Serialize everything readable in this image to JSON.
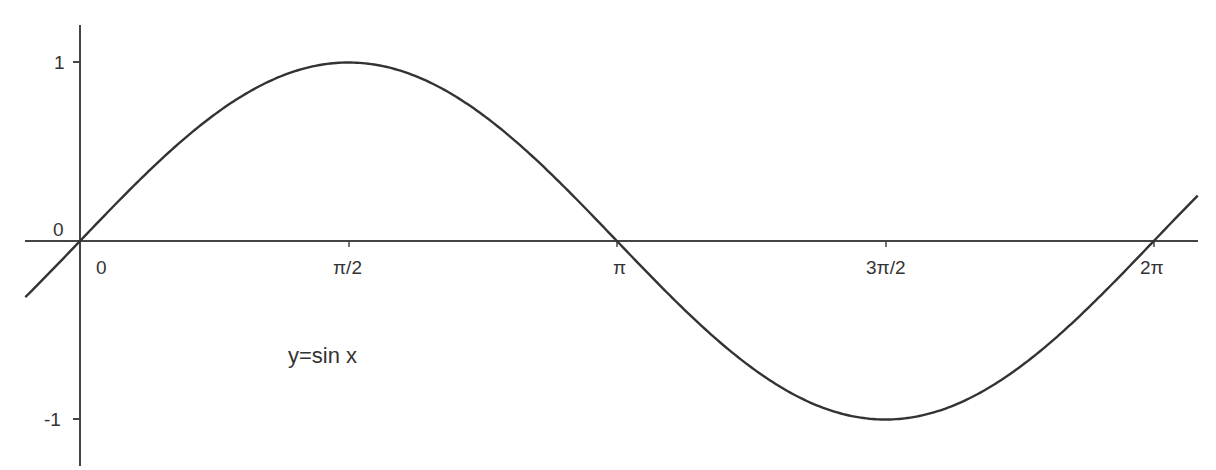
{
  "chart_data": {
    "type": "line",
    "title": "",
    "function_label": "y=sin x",
    "xlabel": "",
    "ylabel": "",
    "x_ticks": [
      {
        "value": 0,
        "label": "0"
      },
      {
        "value": 1.5708,
        "label": "π/2"
      },
      {
        "value": 3.1416,
        "label": "π"
      },
      {
        "value": 4.7124,
        "label": "3π/2"
      },
      {
        "value": 6.2832,
        "label": "2π"
      }
    ],
    "y_ticks": [
      {
        "value": 1,
        "label": "1"
      },
      {
        "value": 0,
        "label": "0"
      },
      {
        "value": -1,
        "label": "-1"
      }
    ],
    "xlim": [
      -0.32,
      6.54
    ],
    "ylim": [
      -1.25,
      1.2
    ],
    "grid": false,
    "legend": "none",
    "series": [
      {
        "name": "y=sin x",
        "x": [
          -0.32,
          0,
          0.5236,
          1.0472,
          1.5708,
          2.0944,
          2.618,
          3.1416,
          3.6652,
          4.1888,
          4.7124,
          5.236,
          5.7596,
          6.2832,
          6.54
        ],
        "values": [
          -0.315,
          0,
          0.5,
          0.866,
          1,
          0.866,
          0.5,
          0,
          -0.5,
          -0.866,
          -1,
          -0.866,
          -0.5,
          0,
          0.25
        ]
      }
    ],
    "line_color": "#333333",
    "axis_color": "#444444"
  },
  "labels": {
    "y_one": "1",
    "y_zero": "0",
    "y_neg_one": "-1",
    "x_zero": "0",
    "x_pi_half": "π/2",
    "x_pi": "π",
    "x_three_pi_half": "3π/2",
    "x_two_pi": "2π",
    "function": "y=sin x"
  }
}
